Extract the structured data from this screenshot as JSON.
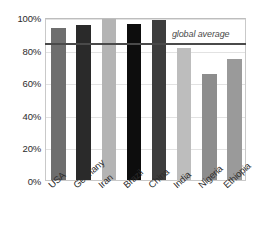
{
  "chart_data": {
    "type": "bar",
    "title": "",
    "subtitle": "",
    "xlabel": "",
    "ylabel": "",
    "categories": [
      "USA",
      "Germany",
      "Iran",
      "Brazil",
      "China",
      "India",
      "Nigeria",
      "Ethiopia"
    ],
    "values": [
      93,
      95,
      99,
      96,
      98,
      81,
      65,
      74
    ],
    "bar_colors": [
      "#6e6e6e",
      "#2a2a2a",
      "#b4b4b4",
      "#0d0d0d",
      "#3d3d3d",
      "#bdbdbd",
      "#8d8d8d",
      "#9a9a9a"
    ],
    "ylim": [
      0,
      100
    ],
    "ytick_labels": [
      "100%",
      "80%",
      "60%",
      "40%",
      "20%",
      "0%"
    ],
    "ytick_values": [
      100,
      80,
      60,
      40,
      20,
      0
    ],
    "grid": true,
    "legend": "none",
    "annotations": [
      {
        "name": "global-average",
        "label": "global average",
        "value": 85,
        "color": "#4a4a4a"
      }
    ]
  }
}
